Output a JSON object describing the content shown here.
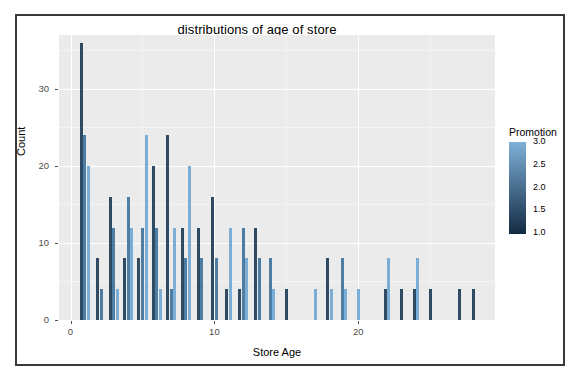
{
  "chart_data": {
    "type": "bar",
    "title": "distributions of age of store",
    "xlabel": "Store Age",
    "ylabel": "Count",
    "xlim": [
      -0.8,
      29.5
    ],
    "ylim": [
      0,
      37
    ],
    "x_ticks": [
      0,
      10,
      20
    ],
    "y_ticks": [
      0,
      10,
      20,
      30
    ],
    "grid": true,
    "legend": {
      "title": "Promotion",
      "type": "continuous-colorbar",
      "ticks": [
        "3.0",
        "2.5",
        "2.0",
        "1.5",
        "1.0"
      ],
      "min": 1.0,
      "max": 3.0,
      "color_min": "#132b43",
      "color_max": "#7eb0d8",
      "position": "right"
    },
    "series": [
      {
        "name": "Promotion 1",
        "color": "#2f4b63"
      },
      {
        "name": "Promotion 2",
        "color": "#4e7da3"
      },
      {
        "name": "Promotion 3",
        "color": "#7cadd4"
      }
    ],
    "bars": [
      {
        "store_age": 1,
        "promotion": 1,
        "count": 36
      },
      {
        "store_age": 1,
        "promotion": 2,
        "count": 24
      },
      {
        "store_age": 1,
        "promotion": 3,
        "count": 20
      },
      {
        "store_age": 2,
        "promotion": 1,
        "count": 8
      },
      {
        "store_age": 2,
        "promotion": 2,
        "count": 4
      },
      {
        "store_age": 3,
        "promotion": 1,
        "count": 16
      },
      {
        "store_age": 3,
        "promotion": 2,
        "count": 12
      },
      {
        "store_age": 3,
        "promotion": 3,
        "count": 4
      },
      {
        "store_age": 4,
        "promotion": 1,
        "count": 8
      },
      {
        "store_age": 4,
        "promotion": 2,
        "count": 16
      },
      {
        "store_age": 4,
        "promotion": 3,
        "count": 12
      },
      {
        "store_age": 5,
        "promotion": 1,
        "count": 8
      },
      {
        "store_age": 5,
        "promotion": 2,
        "count": 12
      },
      {
        "store_age": 5,
        "promotion": 3,
        "count": 24
      },
      {
        "store_age": 6,
        "promotion": 1,
        "count": 20
      },
      {
        "store_age": 6,
        "promotion": 2,
        "count": 12
      },
      {
        "store_age": 6,
        "promotion": 3,
        "count": 4
      },
      {
        "store_age": 7,
        "promotion": 1,
        "count": 24
      },
      {
        "store_age": 7,
        "promotion": 2,
        "count": 4
      },
      {
        "store_age": 7,
        "promotion": 3,
        "count": 12
      },
      {
        "store_age": 8,
        "promotion": 1,
        "count": 12
      },
      {
        "store_age": 8,
        "promotion": 2,
        "count": 8
      },
      {
        "store_age": 8,
        "promotion": 3,
        "count": 20
      },
      {
        "store_age": 9,
        "promotion": 1,
        "count": 12
      },
      {
        "store_age": 9,
        "promotion": 2,
        "count": 8
      },
      {
        "store_age": 10,
        "promotion": 1,
        "count": 16
      },
      {
        "store_age": 10,
        "promotion": 2,
        "count": 8
      },
      {
        "store_age": 11,
        "promotion": 1,
        "count": 4
      },
      {
        "store_age": 11,
        "promotion": 3,
        "count": 12
      },
      {
        "store_age": 12,
        "promotion": 1,
        "count": 4
      },
      {
        "store_age": 12,
        "promotion": 2,
        "count": 12
      },
      {
        "store_age": 12,
        "promotion": 3,
        "count": 8
      },
      {
        "store_age": 13,
        "promotion": 1,
        "count": 12
      },
      {
        "store_age": 13,
        "promotion": 2,
        "count": 8
      },
      {
        "store_age": 14,
        "promotion": 2,
        "count": 8
      },
      {
        "store_age": 14,
        "promotion": 3,
        "count": 4
      },
      {
        "store_age": 15,
        "promotion": 1,
        "count": 4
      },
      {
        "store_age": 17,
        "promotion": 3,
        "count": 4
      },
      {
        "store_age": 18,
        "promotion": 1,
        "count": 8
      },
      {
        "store_age": 18,
        "promotion": 3,
        "count": 4
      },
      {
        "store_age": 19,
        "promotion": 2,
        "count": 8
      },
      {
        "store_age": 19,
        "promotion": 3,
        "count": 4
      },
      {
        "store_age": 20,
        "promotion": 3,
        "count": 4
      },
      {
        "store_age": 22,
        "promotion": 1,
        "count": 4
      },
      {
        "store_age": 22,
        "promotion": 3,
        "count": 8
      },
      {
        "store_age": 23,
        "promotion": 1,
        "count": 4
      },
      {
        "store_age": 24,
        "promotion": 1,
        "count": 4
      },
      {
        "store_age": 24,
        "promotion": 3,
        "count": 8
      },
      {
        "store_age": 25,
        "promotion": 1,
        "count": 4
      },
      {
        "store_age": 27,
        "promotion": 1,
        "count": 4
      },
      {
        "store_age": 28,
        "promotion": 1,
        "count": 4
      }
    ]
  }
}
